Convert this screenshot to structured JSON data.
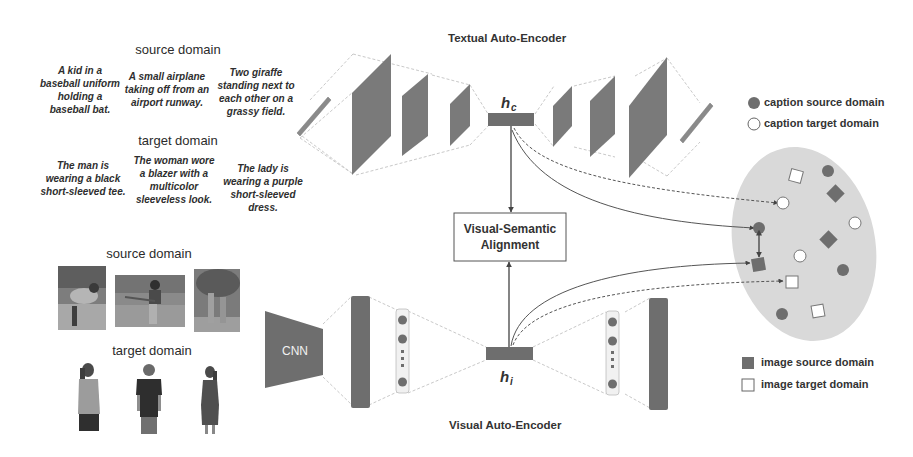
{
  "text_panel": {
    "source_heading": "source domain",
    "target_heading": "target domain",
    "source_captions": [
      "A kid in a baseball uniform holding a baseball bat.",
      "A small airplane taking off from an airport runway.",
      "Two giraffe standing next to each other on a grassy field."
    ],
    "target_captions": [
      "The man is wearing a black short-sleeved tee.",
      "The woman wore a blazer with a multicolor sleeveless look.",
      "The lady is wearing a purple short-sleeved dress."
    ]
  },
  "image_panel": {
    "source_heading": "source domain",
    "target_heading": "target domain",
    "source_images": [
      "baseball-player-photo",
      "batter-photo",
      "giraffes-photo"
    ],
    "target_images": [
      "woman-floral-top-photo",
      "man-black-tee-photo",
      "woman-dress-photo"
    ]
  },
  "textual_ae": {
    "title": "Textual Auto-Encoder",
    "latent_label": "h",
    "latent_sub": "c"
  },
  "visual_ae": {
    "title": "Visual Auto-Encoder",
    "cnn_label": "CNN",
    "latent_label": "h",
    "latent_sub": "i"
  },
  "alignment": {
    "line1": "Visual-Semantic",
    "line2": "Alignment"
  },
  "legend": {
    "caption_source": "caption source domain",
    "caption_target": "caption target domain",
    "image_source": "image source domain",
    "image_target": "image target domain"
  },
  "colors": {
    "dark_block": "#6e6e6e",
    "ellipse_fill": "#d9d9d9",
    "line": "#555555",
    "guide": "#c8c8c8"
  }
}
